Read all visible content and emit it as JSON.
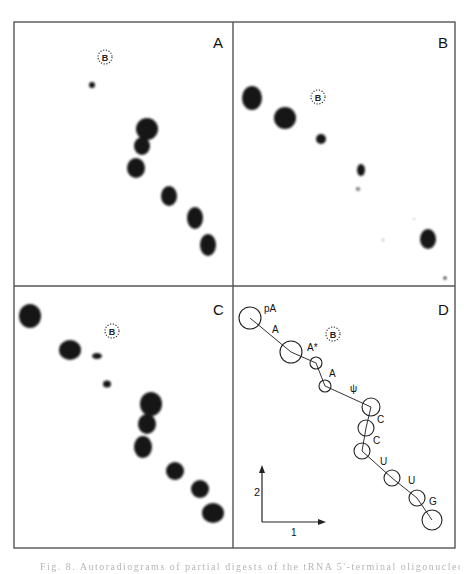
{
  "figure": {
    "frame": {
      "x1": 14,
      "y1": 22,
      "x2": 455,
      "y2": 548,
      "divider_x": 233,
      "divider_y": 286
    },
    "colors": {
      "spot": "#151515",
      "line": "#333333",
      "frame": "#555555",
      "background": "#ffffff"
    },
    "panels": [
      {
        "id": "A",
        "label": "A",
        "label_pos": [
          213,
          48
        ],
        "marker": {
          "text": "B",
          "x": 105,
          "y": 57,
          "r": 7
        },
        "spots": [
          {
            "x": 92,
            "y": 85,
            "rx": 3,
            "ry": 3
          },
          {
            "x": 147,
            "y": 129,
            "rx": 11,
            "ry": 11
          },
          {
            "x": 142,
            "y": 146,
            "rx": 8,
            "ry": 9
          },
          {
            "x": 136,
            "y": 168,
            "rx": 9,
            "ry": 10
          },
          {
            "x": 169,
            "y": 196,
            "rx": 8,
            "ry": 10
          },
          {
            "x": 195,
            "y": 218,
            "rx": 8,
            "ry": 11
          },
          {
            "x": 208,
            "y": 245,
            "rx": 8,
            "ry": 11
          }
        ]
      },
      {
        "id": "B",
        "label": "B",
        "label_pos": [
          438,
          48
        ],
        "marker": {
          "text": "B",
          "x": 318,
          "y": 97,
          "r": 7
        },
        "spots": [
          {
            "x": 252,
            "y": 98,
            "rx": 10,
            "ry": 12
          },
          {
            "x": 285,
            "y": 118,
            "rx": 11,
            "ry": 11
          },
          {
            "x": 321,
            "y": 139,
            "rx": 5,
            "ry": 5
          },
          {
            "x": 361,
            "y": 170,
            "rx": 4,
            "ry": 6
          },
          {
            "x": 358,
            "y": 189,
            "rx": 2,
            "ry": 2,
            "opacity": 0.6
          },
          {
            "x": 428,
            "y": 239,
            "rx": 8,
            "ry": 10
          },
          {
            "x": 445,
            "y": 278,
            "rx": 1.5,
            "ry": 1.5
          },
          {
            "x": 383,
            "y": 240,
            "rx": 1,
            "ry": 1,
            "opacity": 0.5
          },
          {
            "x": 414,
            "y": 219,
            "rx": 1,
            "ry": 1,
            "opacity": 0.3
          }
        ]
      },
      {
        "id": "C",
        "label": "C",
        "label_pos": [
          213,
          315
        ],
        "marker": {
          "text": "B",
          "x": 112,
          "y": 331,
          "r": 7
        },
        "spots": [
          {
            "x": 30,
            "y": 316,
            "rx": 11,
            "ry": 12
          },
          {
            "x": 70,
            "y": 350,
            "rx": 11,
            "ry": 10
          },
          {
            "x": 97,
            "y": 356,
            "rx": 5,
            "ry": 3
          },
          {
            "x": 107,
            "y": 384,
            "rx": 4,
            "ry": 3.5
          },
          {
            "x": 151,
            "y": 404,
            "rx": 11,
            "ry": 12
          },
          {
            "x": 147,
            "y": 424,
            "rx": 9,
            "ry": 10
          },
          {
            "x": 143,
            "y": 447,
            "rx": 9,
            "ry": 11
          },
          {
            "x": 175,
            "y": 471,
            "rx": 9,
            "ry": 9
          },
          {
            "x": 200,
            "y": 489,
            "rx": 9,
            "ry": 9
          },
          {
            "x": 213,
            "y": 513,
            "rx": 11,
            "ry": 10
          }
        ]
      },
      {
        "id": "D",
        "label": "D",
        "label_pos": [
          438,
          315
        ],
        "marker": {
          "text": "B",
          "x": 333,
          "y": 334,
          "r": 7
        },
        "circles": [
          {
            "x": 250,
            "y": 318,
            "r": 11,
            "label": "pA",
            "lx": 264,
            "ly": 312
          },
          {
            "x": 291,
            "y": 352,
            "r": 11,
            "label": "A",
            "lx": 272,
            "ly": 333
          },
          {
            "x": 316,
            "y": 363,
            "r": 6,
            "label": "A*",
            "lx": 307,
            "ly": 351
          },
          {
            "x": 325,
            "y": 386,
            "r": 6,
            "label": "A",
            "lx": 329,
            "ly": 377
          },
          {
            "x": 371,
            "y": 407,
            "r": 9,
            "label": "ψ",
            "lx": 350,
            "ly": 392
          },
          {
            "x": 366,
            "y": 428,
            "r": 8,
            "label": "C",
            "lx": 377,
            "ly": 423
          },
          {
            "x": 362,
            "y": 451,
            "r": 8,
            "label": "C",
            "lx": 373,
            "ly": 444
          },
          {
            "x": 392,
            "y": 478,
            "r": 8,
            "label": "U",
            "lx": 380,
            "ly": 465
          },
          {
            "x": 417,
            "y": 498,
            "r": 8,
            "label": "U",
            "lx": 408,
            "ly": 484
          },
          {
            "x": 432,
            "y": 520,
            "r": 10,
            "label": "G",
            "lx": 429,
            "ly": 505
          }
        ],
        "path": [
          [
            250,
            318
          ],
          [
            291,
            352
          ],
          [
            316,
            363
          ],
          [
            325,
            386
          ],
          [
            371,
            407
          ],
          [
            366,
            428
          ],
          [
            362,
            451
          ],
          [
            392,
            478
          ],
          [
            417,
            498
          ],
          [
            432,
            520
          ]
        ],
        "axes": {
          "origin": [
            262,
            522
          ],
          "dim1_label": "1",
          "dim2_label": "2",
          "x_end": [
            326,
            522
          ],
          "y_end": [
            262,
            465
          ],
          "label1_pos": [
            291,
            536
          ],
          "label2_pos": [
            254,
            496
          ]
        }
      }
    ],
    "caption_partial": "Fig. 8. Autoradiograms of partial digests of the tRNA 5'-terminal oligonucleotide"
  }
}
